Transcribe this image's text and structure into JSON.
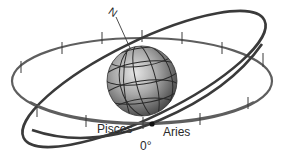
{
  "diagram": {
    "labels": {
      "north": "N",
      "pisces": "Pisces",
      "aries": "Aries",
      "zero": "0°"
    },
    "colors": {
      "equator": "#5a5a5a",
      "ecliptic": "#3a3a3a",
      "globe_light": "#d8d8d8",
      "globe_dark": "#4a4a4a",
      "grid": "#2a2a2a"
    }
  }
}
